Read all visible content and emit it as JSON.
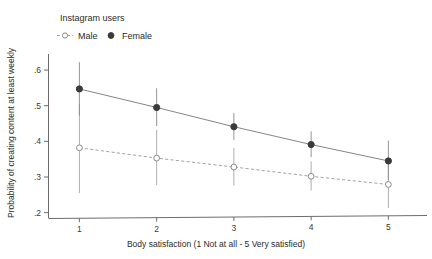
{
  "chart_data": {
    "type": "line",
    "title": "",
    "xlabel": "Body satisfaction (1 Not at all - 5 Very satisfied)",
    "ylabel": "Probability of creating content at least weekly",
    "legend_title": "Instagram users",
    "legend_position": "top-left",
    "grid": false,
    "x": [
      1,
      2,
      3,
      4,
      5
    ],
    "xticklabels": [
      "1",
      "2",
      "3",
      "4",
      "5"
    ],
    "xlim": [
      0.6,
      5.5
    ],
    "ylim": [
      0.185,
      0.645
    ],
    "yticks": [
      0.2,
      0.3,
      0.4,
      0.5,
      0.6
    ],
    "yticklabels": [
      ".2",
      ".3",
      ".4",
      ".5",
      ".6"
    ],
    "series": [
      {
        "name": "Male",
        "marker": "open-circle",
        "linestyle": "dashed",
        "color": "#9a9a9a",
        "values": [
          0.382,
          0.353,
          0.328,
          0.302,
          0.279
        ],
        "ci_low": [
          0.255,
          0.277,
          0.276,
          0.262,
          0.213
        ],
        "ci_high": [
          0.506,
          0.432,
          0.382,
          0.344,
          0.349
        ]
      },
      {
        "name": "Female",
        "marker": "filled-circle",
        "linestyle": "solid",
        "color": "#3b3b3b",
        "values": [
          0.547,
          0.495,
          0.441,
          0.391,
          0.345
        ],
        "ci_low": [
          0.472,
          0.443,
          0.404,
          0.356,
          0.291
        ],
        "ci_high": [
          0.622,
          0.549,
          0.48,
          0.428,
          0.402
        ]
      }
    ]
  },
  "legend": {
    "title": "Instagram users",
    "entries": [
      {
        "label": "Male",
        "marker": "open-circle-with-line-icon"
      },
      {
        "label": "Female",
        "marker": "filled-circle-icon"
      }
    ]
  },
  "axes": {
    "x_title": "Body satisfaction (1 Not at all - 5 Very satisfied)",
    "y_title": "Probability of creating content at least weekly"
  }
}
